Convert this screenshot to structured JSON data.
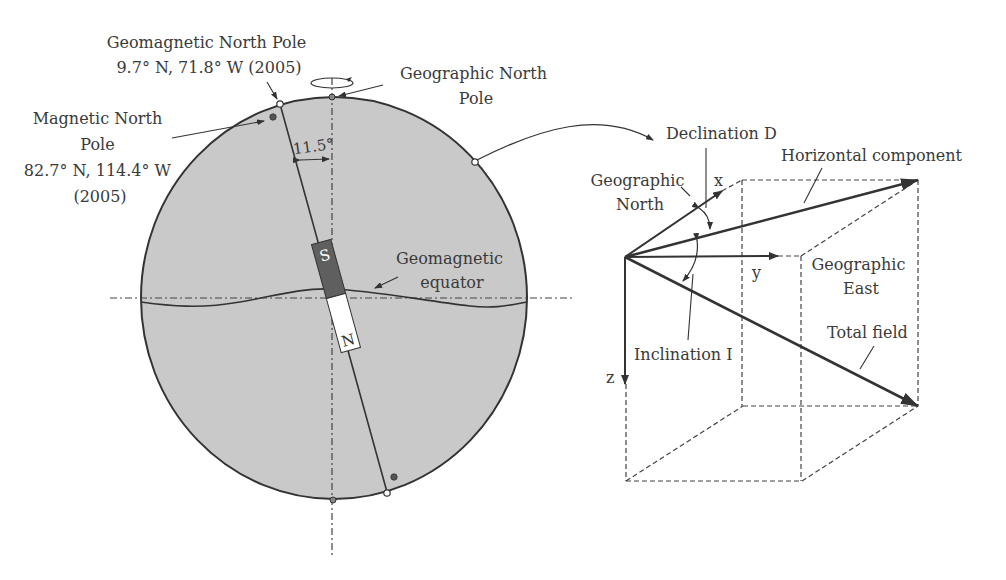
{
  "colors": {
    "globe_fill": "#c9c9c9",
    "outline": "#333333",
    "text": "#3a3a3a",
    "magnet_south": "#5f5f5f",
    "magnet_north": "#ffffff"
  },
  "globe": {
    "labels": {
      "geomagnetic_north_pole": [
        "Geomagnetic North Pole",
        "9.7° N, 71.8° W (2005)"
      ],
      "magnetic_north_pole": [
        "Magnetic North",
        "Pole",
        "82.7° N, 114.4° W",
        "(2005)"
      ],
      "geographic_north_pole": [
        "Geographic North",
        "Pole"
      ],
      "tilt_angle": "11.5°",
      "geomagnetic_equator": [
        "Geomagnetic",
        "equator"
      ]
    },
    "magnet": {
      "south_label": "S",
      "north_label": "N"
    }
  },
  "field_diagram": {
    "labels": {
      "declination": "Declination D",
      "geographic_north": [
        "Geographic",
        "North"
      ],
      "horizontal_component": "Horizontal component",
      "geographic_east": [
        "Geographic",
        "East"
      ],
      "total_field": "Total field",
      "inclination": "Inclination I",
      "axis_x": "x",
      "axis_y": "y",
      "axis_z": "z"
    }
  }
}
